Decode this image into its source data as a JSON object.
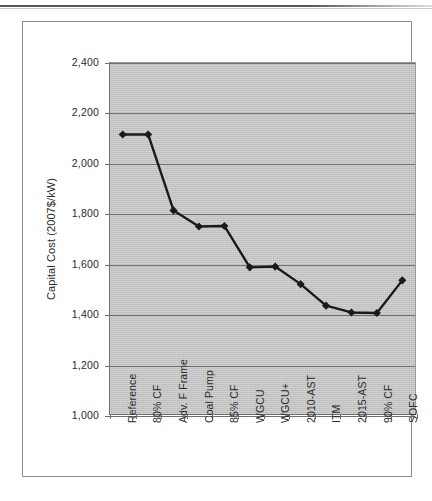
{
  "figure": {
    "y_axis_title": "Capital Cost (2007$/kW)",
    "y_tick_labels": [
      "2,400",
      "2,200",
      "2,000",
      "1,800",
      "1,600",
      "1,400",
      "1,200",
      "1,000"
    ],
    "x_tick_labels": [
      "Reference",
      "80% CF",
      "Adv. F Frame",
      "Coal Pump",
      "85% CF",
      "WGCU",
      "WGCU+",
      "2010-AST",
      "ITM",
      "2015-AST",
      "90% CF",
      "SOFC"
    ],
    "colors": {
      "plot_background": "#c9c9c9",
      "gridline": "#6f6f6f",
      "series_line": "#1a1a1a",
      "marker": "#1a1a1a",
      "frame_border": "#8d8d8d",
      "text": "#2b2b2b"
    }
  },
  "chart_data": {
    "type": "line",
    "title": "",
    "xlabel": "",
    "ylabel": "Capital Cost (2007$/kW)",
    "ylim": [
      1000,
      2400
    ],
    "ytick_step": 200,
    "grid": true,
    "legend": "none",
    "marker": "diamond",
    "categories": [
      "Reference",
      "80% CF",
      "Adv. F Frame",
      "Coal Pump",
      "85% CF",
      "WGCU",
      "WGCU+",
      "2010-AST",
      "ITM",
      "2015-AST",
      "90% CF",
      "SOFC"
    ],
    "values": [
      2115,
      2115,
      1812,
      1748,
      1750,
      1585,
      1588,
      1518,
      1432,
      1405,
      1403,
      1533
    ]
  }
}
